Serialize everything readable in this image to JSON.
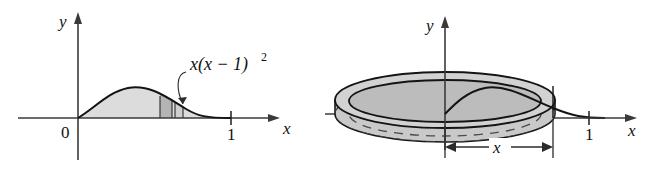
{
  "figure": {
    "panels": [
      {
        "id": "left",
        "name": "region-under-curve",
        "axes": {
          "y_axis_label": "y",
          "x_axis_label": "x",
          "origin_label": "0",
          "x_tick_labels": [
            "1"
          ]
        },
        "curve": {
          "expression_label": "x(x − 1)",
          "exponent": "2",
          "domain": [
            0,
            1
          ],
          "shaded": true
        },
        "strip": {
          "name": "representative-rectangle",
          "has_leader_line": true
        }
      },
      {
        "id": "right",
        "name": "solid-of-revolution-disk",
        "axes": {
          "y_axis_label": "y",
          "x_axis_label": "x",
          "x_tick_labels": [
            "1"
          ]
        },
        "dimension": {
          "label": "x",
          "style": "double-headed-arrow"
        },
        "solid": {
          "type": "cylindrical-shell",
          "hidden_edges": "dashed"
        }
      }
    ],
    "colors": {
      "ink": "#111111",
      "shade_light": "#dcdcdc",
      "shade_mid": "#c9c9c9",
      "shade_dark": "#b4b4b4",
      "shade_top": "#d2d2d2",
      "background": "#ffffff"
    }
  }
}
